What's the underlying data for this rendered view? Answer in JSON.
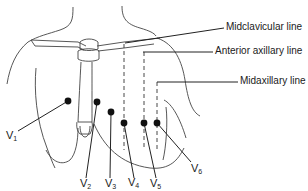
{
  "diagram": {
    "line_labels": {
      "midclavicular": "Midclavicular line",
      "anterior_axillary": "Anterior axillary line",
      "midaxillary": "Midaxillary line"
    },
    "leads": [
      {
        "id": "V1",
        "letter": "V",
        "sub": "1"
      },
      {
        "id": "V2",
        "letter": "V",
        "sub": "2"
      },
      {
        "id": "V3",
        "letter": "V",
        "sub": "3"
      },
      {
        "id": "V4",
        "letter": "V",
        "sub": "4"
      },
      {
        "id": "V5",
        "letter": "V",
        "sub": "5"
      },
      {
        "id": "V6",
        "letter": "V",
        "sub": "6"
      }
    ],
    "colors": {
      "stroke": "#333333",
      "electrode": "#111111",
      "text": "#1a1a1a"
    }
  }
}
